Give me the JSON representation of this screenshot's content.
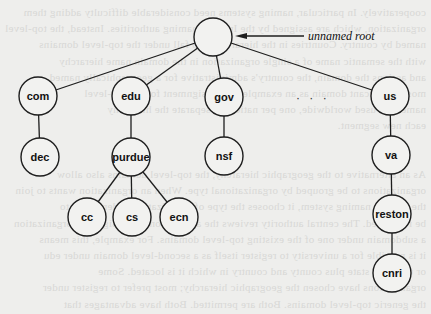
{
  "diagram": {
    "type": "tree",
    "root": {
      "id": "root",
      "label": "",
      "annotation": "unnamed root",
      "cx": 213,
      "cy": 37
    },
    "node_radius": 19,
    "nodes": [
      {
        "id": "com",
        "label": "com",
        "cx": 38,
        "cy": 96,
        "parent": "root"
      },
      {
        "id": "edu",
        "label": "edu",
        "cx": 131,
        "cy": 96,
        "parent": "root"
      },
      {
        "id": "gov",
        "label": "gov",
        "cx": 224,
        "cy": 97,
        "parent": "root"
      },
      {
        "id": "us",
        "label": "us",
        "cx": 390,
        "cy": 96,
        "parent": "root"
      },
      {
        "id": "dec",
        "label": "dec",
        "cx": 40,
        "cy": 157,
        "parent": "com"
      },
      {
        "id": "purdue",
        "label": "purdue",
        "cx": 131,
        "cy": 157,
        "parent": "edu"
      },
      {
        "id": "nsf",
        "label": "nsf",
        "cx": 224,
        "cy": 156,
        "parent": "gov"
      },
      {
        "id": "va",
        "label": "va",
        "cx": 391,
        "cy": 155,
        "parent": "us"
      },
      {
        "id": "cc",
        "label": "cc",
        "cx": 87,
        "cy": 217,
        "parent": "purdue"
      },
      {
        "id": "cs",
        "label": "cs",
        "cx": 132,
        "cy": 217,
        "parent": "purdue"
      },
      {
        "id": "ecn",
        "label": "ecn",
        "cx": 179,
        "cy": 217,
        "parent": "purdue"
      },
      {
        "id": "reston",
        "label": "reston",
        "cx": 392,
        "cy": 214,
        "parent": "va"
      },
      {
        "id": "cnri",
        "label": "cnri",
        "cx": 392,
        "cy": 273,
        "parent": "reston"
      }
    ],
    "ellipsis": {
      "text": "· · ·",
      "x": 296,
      "y": 98
    },
    "annotation_arrow": {
      "from_x": 304,
      "to_x": 235,
      "y": 36,
      "label_x": 308,
      "label_y": 40
    }
  },
  "colors": {
    "background": "#eeeeec",
    "stroke": "#1e1e1e",
    "node_fill": "#f2f2f0",
    "text": "#111111"
  },
  "bleed_through": [
    "cooperatively. In particular, naming systems need considerable difficulty adding them",
    "organization, which are assigned by the Internet naming authorities. Instead, the top-level",
    "named by country. Countries in the hierarchy also fall under the top-level domains",
    "with the semantic name of a single organization in the domain name hierarchy",
    "and assigns the domain, the country's administrative for a geographically named",
    "most-significant domain as an example. The assignment for the top-level",
    "names are used worldwide, one per nation, to separate the hierarchy",
    "each new segment.",
    "",
    "",
    "As an alternative to the geographic hierarchy, the top-level domains also allow",
    "organizations to be grouped by organizational type. When an organization wants to join",
    "the domain naming system, it chooses the type of organization under which to",
    "be registered. The central authority reviews the application and assigns the organization",
    "a subdomain under one of the existing top-level domains. For example, this means",
    "it is possible for a university to register itself as a second-level domain under edu",
    "or under its state plus county and country in which it is located. Some",
    "organizations have chosen the geographic hierarchy; most prefer to register under",
    "the generic top-level domains. Both are permitted. Both have advantages that"
  ]
}
